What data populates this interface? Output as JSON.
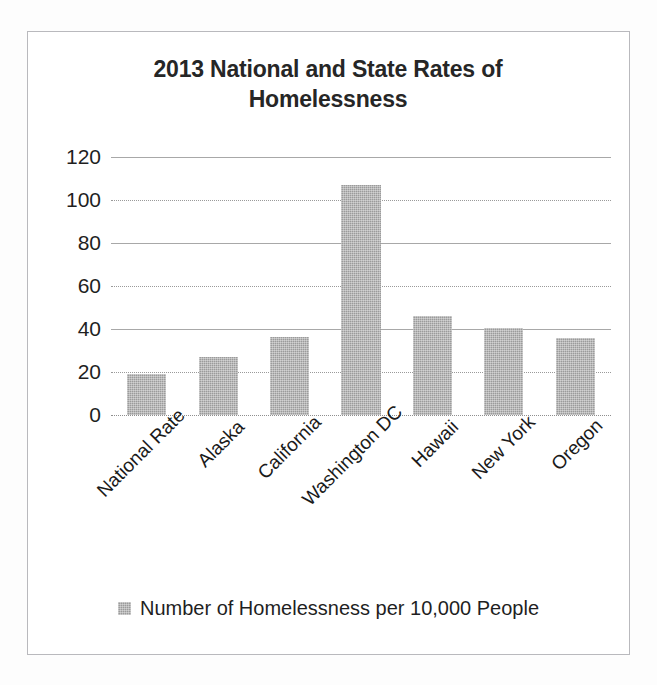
{
  "chart_data": {
    "type": "bar",
    "title": "2013 National and State Rates of Homelessness",
    "title_line1": "2013 National and State Rates of",
    "title_line2": "Homelessness",
    "categories": [
      "National Rate",
      "Alaska",
      "California",
      "Washington DC",
      "Hawaii",
      "New York",
      "Oregon"
    ],
    "values": [
      19,
      27,
      36.5,
      107,
      46,
      40.5,
      36
    ],
    "series": [
      {
        "name": "Number of Homelessness per 10,000 People",
        "values": [
          19,
          27,
          36.5,
          107,
          46,
          40.5,
          36
        ]
      }
    ],
    "xlabel": "",
    "ylabel": "",
    "ylim": [
      0,
      120
    ],
    "ytick_values": [
      120,
      100,
      80,
      60,
      40,
      20,
      0
    ],
    "ytick_labels": [
      "120",
      "100",
      "80",
      "60",
      "40",
      "20",
      "0"
    ],
    "grid": true,
    "legend": {
      "position": "bottom",
      "entries": [
        "Number of Homelessness per 10,000 People"
      ]
    },
    "colors": {
      "bar_fill": "#9b9b9b",
      "gridline": "#a8a8a8",
      "text": "#1f1f1f",
      "frame_border": "#b9b9bd",
      "background": "#ffffff"
    }
  }
}
